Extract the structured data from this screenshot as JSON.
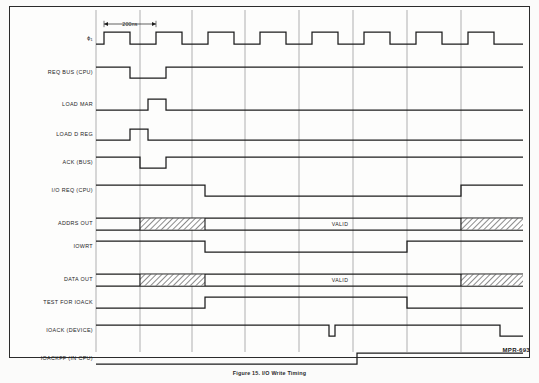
{
  "figure": {
    "plate_id": "MPR-693",
    "caption": "Figure 15. I/O Write Timing",
    "tick_annotation": "200ns",
    "valid_text": "VALID",
    "frame": {
      "x": 9,
      "y": 6,
      "width": 521,
      "height": 352
    },
    "colors": {
      "background": "#fbfbfa",
      "frame_border": "#2b2b2b",
      "waveform": "#1c1c1c",
      "gridline": "#7d7d7d",
      "hatch": "#5a5a5a",
      "text": "#1c1c1c"
    }
  },
  "axis": {
    "label_right_edge": 93,
    "wave_start_x": 96,
    "wave_end_x": 523,
    "gridlines_x": [
      96,
      140,
      192,
      245,
      299,
      353,
      407,
      461
    ],
    "clock_period_px": 52,
    "clock_high_px": 26,
    "clock_first_rise_x": 104,
    "clock_pulse_count": 8,
    "tick_marker": {
      "x1": 104,
      "x2": 156,
      "y": 24
    }
  },
  "signals": [
    {
      "name": "clock",
      "label": "ϕ₁",
      "row_y": 44,
      "kind": "clock",
      "amplitude": 12
    },
    {
      "name": "req-bus-cpu",
      "label": "REQ BUS (CPU)",
      "row_y": 78,
      "kind": "level",
      "amplitude": 11,
      "initial": "high",
      "transitions": [
        130,
        166
      ]
    },
    {
      "name": "load-mar",
      "label": "LOAD MAR",
      "row_y": 110,
      "kind": "level",
      "amplitude": 11,
      "initial": "low",
      "transitions": [
        148,
        166
      ]
    },
    {
      "name": "load-d-reg",
      "label": "LOAD D REG",
      "row_y": 140,
      "kind": "level",
      "amplitude": 11,
      "initial": "low",
      "transitions": [
        130,
        148
      ]
    },
    {
      "name": "ack-bus",
      "label": "ACK (BUS)",
      "row_y": 168,
      "kind": "level",
      "amplitude": 11,
      "initial": "high",
      "transitions": [
        140,
        166
      ]
    },
    {
      "name": "io-req-cpu",
      "label": "I/O REQ (CPU)",
      "row_y": 196,
      "kind": "level",
      "amplitude": 11,
      "initial": "high",
      "transitions": [
        205,
        461
      ]
    },
    {
      "name": "addrs-out",
      "label": "ADDRS OUT",
      "row_y": 224,
      "kind": "bus",
      "amplitude": 6,
      "hatch_spans": [
        [
          140,
          205
        ],
        [
          461,
          523
        ]
      ],
      "valid_label_x": 340
    },
    {
      "name": "iowrt",
      "label": "IOWRT",
      "row_y": 252,
      "kind": "level",
      "amplitude": 11,
      "initial": "high",
      "transitions": [
        205,
        407
      ]
    },
    {
      "name": "data-out",
      "label": "DATA OUT",
      "row_y": 280,
      "kind": "bus",
      "amplitude": 6,
      "hatch_spans": [
        [
          140,
          205
        ],
        [
          461,
          523
        ]
      ],
      "valid_label_x": 340
    },
    {
      "name": "test-for-ioack",
      "label": "TEST FOR IOACK",
      "row_y": 308,
      "kind": "level",
      "amplitude": 11,
      "initial": "low",
      "transitions": [
        205,
        407
      ]
    },
    {
      "name": "ioack-device",
      "label": "IOACK (DEVICE)",
      "row_y": 336,
      "kind": "level",
      "amplitude": 11,
      "initial": "high",
      "transitions": [
        329,
        335,
        500
      ]
    },
    {
      "name": "ioackff-in-cpu",
      "label": "IOACKFF (IN CPU)",
      "row_y": 364,
      "kind": "level",
      "amplitude": 11,
      "initial": "low",
      "transitions": [
        357
      ]
    }
  ]
}
